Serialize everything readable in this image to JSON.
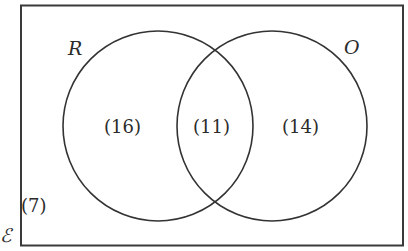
{
  "diagram": {
    "type": "venn",
    "universe": {
      "symbol": "ℰ",
      "outside_count": "(7)"
    },
    "sets": [
      {
        "name": "R",
        "label": "R",
        "only_count": "(16)"
      },
      {
        "name": "O",
        "label": "O",
        "only_count": "(14)"
      }
    ],
    "intersection": {
      "sets": [
        "R",
        "O"
      ],
      "count": "(11)"
    },
    "colors": {
      "stroke": "#333333",
      "background": "#ffffff",
      "text": "#2b2b2b"
    }
  }
}
